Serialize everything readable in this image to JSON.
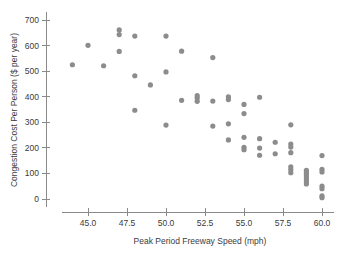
{
  "chart_data": {
    "type": "scatter",
    "title": "",
    "xlabel": "Peak Period Freeway Speed (mph)",
    "ylabel": "Congestion Cost Per Person ($ per year)",
    "xlim": [
      43.2,
      60.8
    ],
    "ylim": [
      -30,
      730
    ],
    "xticks": [
      45.0,
      47.5,
      50.0,
      52.5,
      55.0,
      57.5,
      60.0
    ],
    "xticklabels": [
      "45.0",
      "47.5",
      "50.0",
      "52.5",
      "55.0",
      "57.5",
      "60.0"
    ],
    "yticks": [
      0,
      100,
      200,
      300,
      400,
      500,
      600,
      700
    ],
    "yticklabels": [
      "0",
      "100",
      "200",
      "300",
      "400",
      "500",
      "600",
      "700"
    ],
    "grid": false,
    "legend": null,
    "marker_color": "#8c8c8c",
    "marker_size": 2.6,
    "points": [
      {
        "x": 44.0,
        "y": 525
      },
      {
        "x": 45.0,
        "y": 601
      },
      {
        "x": 46.0,
        "y": 521
      },
      {
        "x": 47.0,
        "y": 661
      },
      {
        "x": 47.0,
        "y": 643
      },
      {
        "x": 47.0,
        "y": 577
      },
      {
        "x": 48.0,
        "y": 637
      },
      {
        "x": 48.0,
        "y": 482
      },
      {
        "x": 48.0,
        "y": 347
      },
      {
        "x": 49.0,
        "y": 446
      },
      {
        "x": 50.0,
        "y": 637
      },
      {
        "x": 50.0,
        "y": 497
      },
      {
        "x": 50.0,
        "y": 289
      },
      {
        "x": 51.0,
        "y": 578
      },
      {
        "x": 51.0,
        "y": 386
      },
      {
        "x": 52.0,
        "y": 404
      },
      {
        "x": 52.0,
        "y": 395
      },
      {
        "x": 52.0,
        "y": 382
      },
      {
        "x": 53.0,
        "y": 553
      },
      {
        "x": 53.0,
        "y": 383
      },
      {
        "x": 53.0,
        "y": 285
      },
      {
        "x": 54.0,
        "y": 399
      },
      {
        "x": 54.0,
        "y": 389
      },
      {
        "x": 54.0,
        "y": 294
      },
      {
        "x": 54.0,
        "y": 231
      },
      {
        "x": 55.0,
        "y": 370
      },
      {
        "x": 55.0,
        "y": 334
      },
      {
        "x": 55.0,
        "y": 241
      },
      {
        "x": 55.0,
        "y": 202
      },
      {
        "x": 55.0,
        "y": 193
      },
      {
        "x": 56.0,
        "y": 398
      },
      {
        "x": 56.0,
        "y": 236
      },
      {
        "x": 56.0,
        "y": 199
      },
      {
        "x": 56.0,
        "y": 171
      },
      {
        "x": 57.0,
        "y": 222
      },
      {
        "x": 57.0,
        "y": 177
      },
      {
        "x": 58.0,
        "y": 290
      },
      {
        "x": 58.0,
        "y": 215
      },
      {
        "x": 58.0,
        "y": 203
      },
      {
        "x": 58.0,
        "y": 181
      },
      {
        "x": 58.0,
        "y": 126
      },
      {
        "x": 58.0,
        "y": 115
      },
      {
        "x": 58.0,
        "y": 103
      },
      {
        "x": 59.0,
        "y": 112
      },
      {
        "x": 59.0,
        "y": 103
      },
      {
        "x": 59.0,
        "y": 95
      },
      {
        "x": 59.0,
        "y": 87
      },
      {
        "x": 59.0,
        "y": 78
      },
      {
        "x": 59.0,
        "y": 68
      },
      {
        "x": 59.0,
        "y": 59
      },
      {
        "x": 60.0,
        "y": 170
      },
      {
        "x": 60.0,
        "y": 116
      },
      {
        "x": 60.0,
        "y": 106
      },
      {
        "x": 60.0,
        "y": 50
      },
      {
        "x": 60.0,
        "y": 40
      },
      {
        "x": 60.0,
        "y": 12
      },
      {
        "x": 60.0,
        "y": 5
      }
    ]
  }
}
